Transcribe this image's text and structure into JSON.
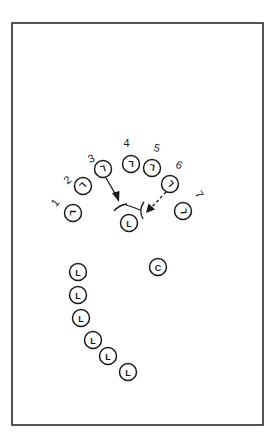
{
  "diagram": {
    "title": "",
    "passers": [
      {
        "number": "1",
        "glyph": "L"
      },
      {
        "number": "2",
        "glyph": "L"
      },
      {
        "number": "3",
        "glyph": "L"
      },
      {
        "number": "4",
        "glyph": "L"
      },
      {
        "number": "5",
        "glyph": "L"
      },
      {
        "number": "6",
        "glyph": "L"
      },
      {
        "number": "7",
        "glyph": "L"
      }
    ],
    "target_player": {
      "glyph": "L"
    },
    "coach": {
      "glyph": "C"
    },
    "waiting_line": [
      {
        "glyph": "L"
      },
      {
        "glyph": "L"
      },
      {
        "glyph": "L"
      },
      {
        "glyph": "L"
      },
      {
        "glyph": "L"
      },
      {
        "glyph": "L"
      }
    ],
    "arrows": [
      {
        "from": "passer-3",
        "to": "target-player",
        "style": "solid"
      },
      {
        "from": "passer-6",
        "to": "target-player",
        "style": "dashed"
      }
    ]
  }
}
